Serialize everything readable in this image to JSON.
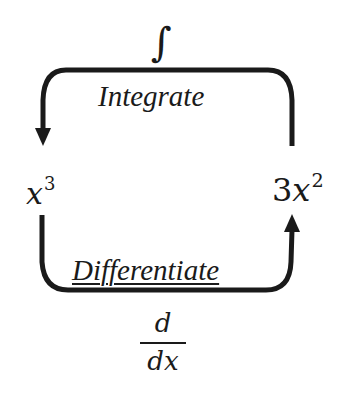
{
  "diagram": {
    "top_symbol": "∫",
    "top_label": "Integrate",
    "bottom_label": "Differentiate",
    "left_expression": {
      "base": "x",
      "exponent": "3"
    },
    "right_expression": {
      "coefficient": "3",
      "base": "x",
      "exponent": "2"
    },
    "bottom_operator": {
      "numerator": "d",
      "denominator": "dx"
    },
    "arrows": [
      {
        "from": "3x^2",
        "to": "x^3",
        "via": "Integrate",
        "path": "top"
      },
      {
        "from": "x^3",
        "to": "3x^2",
        "via": "Differentiate",
        "path": "bottom"
      }
    ],
    "colors": {
      "stroke": "#1a1a1a",
      "background": "#ffffff"
    }
  }
}
